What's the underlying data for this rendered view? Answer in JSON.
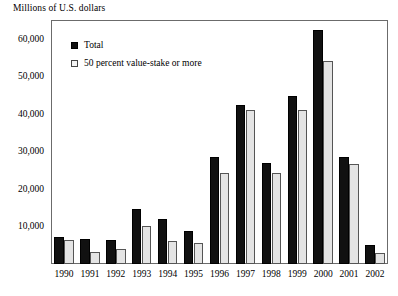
{
  "chart_data": {
    "type": "bar",
    "title": "",
    "subtitle": "",
    "ylabel": "Millions of U.S. dollars",
    "xlabel": "",
    "ylim": [
      0,
      65000
    ],
    "yticks": [
      10000,
      20000,
      30000,
      40000,
      50000,
      60000
    ],
    "ytick_labels": [
      "10,000",
      "20,000",
      "30,000",
      "40,000",
      "50,000",
      "60,000"
    ],
    "grid": false,
    "legend_position": "upper-left-inside",
    "categories": [
      "1990",
      "1991",
      "1992",
      "1993",
      "1994",
      "1995",
      "1996",
      "1997",
      "1998",
      "1999",
      "2000",
      "2001",
      "2002"
    ],
    "series": [
      {
        "name": "Total",
        "color": "#111111",
        "values": [
          7300,
          6600,
          6400,
          14600,
          12100,
          8900,
          28400,
          42400,
          26800,
          44700,
          62300,
          28500,
          5100
        ]
      },
      {
        "name": "50 percent value-stake or more",
        "color": "#e4e4e4",
        "values": [
          6500,
          3100,
          3900,
          10200,
          6200,
          5700,
          24200,
          41000,
          24300,
          40900,
          54200,
          26600,
          3000
        ]
      }
    ]
  },
  "figure": {
    "axis_title": "Millions of U.S. dollars"
  },
  "legend": {
    "items": [
      {
        "label": "Total",
        "swatch": "filled-square-icon"
      },
      {
        "label": "50 percent value-stake or more",
        "swatch": "outline-square-icon"
      }
    ]
  }
}
